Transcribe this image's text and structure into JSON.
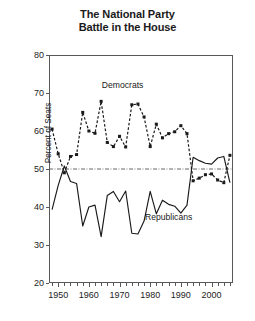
{
  "chart_data": {
    "type": "line",
    "title": "The National Party Battle in the House",
    "title_lines": [
      "The National Party",
      "Battle in the House"
    ],
    "xlabel": "",
    "ylabel": "Percent of Seats",
    "xlim": [
      1947,
      2007
    ],
    "ylim": [
      20,
      80
    ],
    "yticks": [
      20,
      30,
      40,
      50,
      60,
      70,
      80
    ],
    "xticks": [
      1948,
      1950,
      1952,
      1954,
      1956,
      1958,
      1960,
      1962,
      1964,
      1966,
      1968,
      1970,
      1972,
      1974,
      1976,
      1978,
      1980,
      1982,
      1984,
      1986,
      1988,
      1990,
      1992,
      1994,
      1996,
      1998,
      2000,
      2002,
      2004,
      2006
    ],
    "xtick_labels": [
      {
        "x": 1950,
        "label": "1950"
      },
      {
        "x": 1960,
        "label": "1960"
      },
      {
        "x": 1970,
        "label": "1970"
      },
      {
        "x": 1980,
        "label": "1980"
      },
      {
        "x": 1990,
        "label": "1990"
      },
      {
        "x": 2000,
        "label": "2000"
      }
    ],
    "grid": false,
    "legend_position": "inline-annotation",
    "reference_lines": [
      {
        "name": "majority-threshold",
        "y": 50,
        "style": "dash-dot",
        "color": "#555555"
      }
    ],
    "annotations": [
      {
        "name": "democrats-label",
        "text": "Democrats",
        "x": 1971,
        "y": 72
      },
      {
        "name": "republicans-label",
        "text": "Republicans",
        "x": 1986,
        "y": 37.5
      }
    ],
    "x": [
      1948,
      1950,
      1952,
      1954,
      1956,
      1958,
      1960,
      1962,
      1964,
      1966,
      1968,
      1970,
      1972,
      1974,
      1976,
      1978,
      1980,
      1982,
      1984,
      1986,
      1988,
      1990,
      1992,
      1994,
      1996,
      1998,
      2000,
      2002,
      2004,
      2006
    ],
    "series": [
      {
        "name": "Democrats",
        "color": "#1a1a1a",
        "line_style": "dashed",
        "marker": "square",
        "values": [
          60.5,
          54.0,
          49.0,
          53.3,
          53.8,
          64.9,
          60.0,
          59.4,
          67.8,
          57.0,
          55.9,
          58.6,
          55.8,
          66.9,
          67.1,
          63.7,
          55.9,
          61.8,
          58.2,
          59.3,
          59.8,
          61.4,
          59.3,
          46.9,
          47.6,
          48.5,
          48.7,
          47.1,
          46.4,
          53.6
        ]
      },
      {
        "name": "Republicans",
        "color": "#1a1a1a",
        "line_style": "solid",
        "marker": "none",
        "values": [
          39.3,
          45.7,
          50.8,
          46.7,
          46.2,
          35.0,
          40.0,
          40.5,
          32.2,
          43.0,
          44.1,
          41.4,
          44.2,
          33.1,
          32.9,
          36.3,
          44.1,
          38.2,
          41.8,
          40.7,
          40.2,
          38.4,
          40.5,
          53.1,
          52.2,
          51.5,
          51.3,
          52.9,
          53.3,
          46.4
        ]
      }
    ]
  }
}
